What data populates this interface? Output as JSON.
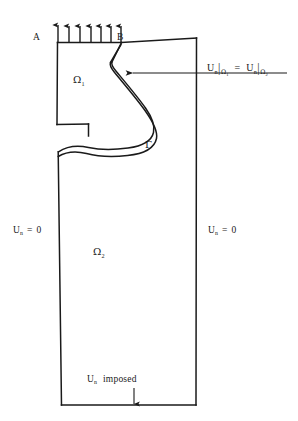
{
  "figure": {
    "stroke_color": "#1a1a1a",
    "background_color": "#ffffff"
  },
  "points": {
    "A": {
      "label": "A",
      "x": 37,
      "y": 38
    },
    "B": {
      "label": "B",
      "x": 120,
      "y": 38
    }
  },
  "domains": {
    "upper": {
      "name": "Omega1",
      "symbol": "Ω",
      "subscript": "1",
      "x": 77,
      "y": 80
    },
    "lower": {
      "name": "Omega2",
      "symbol": "Ω",
      "subscript": "2",
      "x": 97,
      "y": 252
    }
  },
  "interface": {
    "name": "Gamma",
    "symbol": "Γ",
    "x": 148,
    "y": 146
  },
  "boundary_conditions": {
    "left": {
      "variable": "U",
      "subscript": "n",
      "relation": "=",
      "value": "0",
      "x": 14,
      "y": 232
    },
    "right": {
      "variable": "U",
      "subscript": "n",
      "relation": "=",
      "value": "0",
      "x": 209,
      "y": 232
    },
    "bottom": {
      "variable": "U",
      "subscript": "n",
      "text": "imposed",
      "x": 88,
      "y": 381
    },
    "top": {
      "description": "uniform upward flux arrows on segment A-B",
      "arrow_count": 7
    }
  },
  "equation": {
    "left_variable": "U",
    "left_subscript": "n",
    "left_restriction_symbol": "Ω",
    "left_restriction_subscript": "1",
    "relation": "=",
    "right_variable": "U",
    "right_subscript": "n",
    "right_restriction_symbol": "Ω",
    "right_restriction_subscript": "2",
    "x": 208,
    "y": 68
  },
  "annotations": {
    "interface_pointer": {
      "name": "arrow-to-interface",
      "from_x": 287,
      "to_x": 131,
      "y": 73
    },
    "bottom_pointer": {
      "name": "arrow-down-to-base",
      "x": 134,
      "from_y": 388,
      "to_y": 404
    }
  }
}
